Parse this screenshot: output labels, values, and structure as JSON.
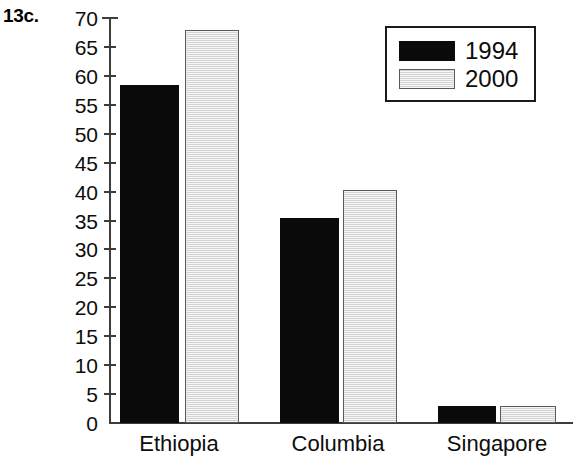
{
  "problem_label": "13c.",
  "chart_data": {
    "type": "bar",
    "title": "",
    "xlabel": "",
    "ylabel": "",
    "categories": [
      "Ethiopia",
      "Columbia",
      "Singapore"
    ],
    "series": [
      {
        "name": "1994",
        "color": "#0a0a0a",
        "values": [
          58.5,
          35.5,
          3
        ]
      },
      {
        "name": "2000",
        "color": "#e4e4e4",
        "values": [
          68,
          40.3,
          3
        ]
      }
    ],
    "ylim": [
      0,
      70
    ],
    "ytick_step": 5,
    "ytick_labels": [
      "70",
      "65",
      "60",
      "55",
      "50",
      "45",
      "40",
      "35",
      "30",
      "25",
      "20",
      "15",
      "10",
      "5",
      "0"
    ],
    "ytick_values": [
      70,
      65,
      60,
      55,
      50,
      45,
      40,
      35,
      30,
      25,
      20,
      15,
      10,
      5,
      0
    ],
    "grid": false,
    "legend_position": "top-right",
    "legend_entries": [
      "1994",
      "2000"
    ]
  }
}
